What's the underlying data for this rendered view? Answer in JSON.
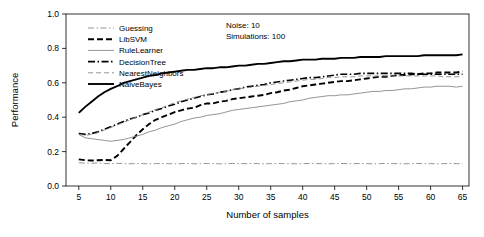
{
  "chart_data": {
    "type": "line",
    "title": "",
    "xlabel": "Number of samples",
    "ylabel": "Performance",
    "xlim": [
      3,
      66
    ],
    "ylim": [
      0.0,
      1.0
    ],
    "grid": false,
    "legend_position": "top-left inside plot",
    "annotations": [
      "Noise: 10",
      "Simulations: 100"
    ],
    "xticks": [
      5,
      10,
      15,
      20,
      25,
      30,
      35,
      40,
      45,
      50,
      55,
      60,
      65
    ],
    "yticks": [
      "0.0",
      "0.2",
      "0.4",
      "0.6",
      "0.8",
      "1.0"
    ],
    "x": [
      5,
      6,
      7,
      8,
      9,
      10,
      11,
      12,
      13,
      14,
      15,
      16,
      17,
      18,
      19,
      20,
      21,
      22,
      23,
      24,
      25,
      26,
      27,
      28,
      29,
      30,
      31,
      32,
      33,
      34,
      35,
      36,
      37,
      38,
      39,
      40,
      41,
      42,
      43,
      44,
      45,
      46,
      47,
      48,
      49,
      50,
      51,
      52,
      53,
      54,
      55,
      56,
      57,
      58,
      59,
      60,
      61,
      62,
      63,
      64,
      65
    ],
    "series": [
      {
        "name": "Guessing",
        "style": "dashdot-thin",
        "color": "#888888",
        "values": [
          0.135,
          0.133,
          0.132,
          0.134,
          0.131,
          0.13,
          0.132,
          0.13,
          0.129,
          0.131,
          0.13,
          0.129,
          0.13,
          0.131,
          0.13,
          0.129,
          0.13,
          0.131,
          0.129,
          0.13,
          0.131,
          0.13,
          0.129,
          0.13,
          0.131,
          0.13,
          0.13,
          0.131,
          0.13,
          0.129,
          0.13,
          0.131,
          0.13,
          0.13,
          0.129,
          0.13,
          0.131,
          0.13,
          0.13,
          0.129,
          0.13,
          0.131,
          0.13,
          0.13,
          0.131,
          0.13,
          0.129,
          0.13,
          0.131,
          0.13,
          0.13,
          0.129,
          0.13,
          0.131,
          0.13,
          0.13,
          0.129,
          0.13,
          0.131,
          0.13,
          0.13
        ]
      },
      {
        "name": "LibSVM",
        "style": "dashed-bold",
        "color": "#000000",
        "values": [
          0.155,
          0.15,
          0.148,
          0.15,
          0.152,
          0.15,
          0.175,
          0.215,
          0.255,
          0.295,
          0.33,
          0.36,
          0.385,
          0.4,
          0.415,
          0.43,
          0.44,
          0.45,
          0.455,
          0.47,
          0.48,
          0.48,
          0.49,
          0.495,
          0.505,
          0.51,
          0.515,
          0.52,
          0.525,
          0.53,
          0.54,
          0.545,
          0.555,
          0.56,
          0.57,
          0.58,
          0.585,
          0.59,
          0.595,
          0.6,
          0.605,
          0.61,
          0.61,
          0.615,
          0.62,
          0.625,
          0.63,
          0.635,
          0.635,
          0.64,
          0.645,
          0.645,
          0.65,
          0.65,
          0.655,
          0.655,
          0.66,
          0.66,
          0.66,
          0.66,
          0.665
        ]
      },
      {
        "name": "RuleLearner",
        "style": "solid-thin",
        "color": "#888888",
        "values": [
          0.3,
          0.28,
          0.275,
          0.27,
          0.265,
          0.26,
          0.265,
          0.27,
          0.28,
          0.29,
          0.3,
          0.315,
          0.325,
          0.34,
          0.35,
          0.36,
          0.375,
          0.385,
          0.395,
          0.4,
          0.41,
          0.415,
          0.42,
          0.43,
          0.44,
          0.445,
          0.45,
          0.455,
          0.46,
          0.465,
          0.47,
          0.475,
          0.48,
          0.49,
          0.495,
          0.5,
          0.51,
          0.515,
          0.52,
          0.525,
          0.525,
          0.53,
          0.53,
          0.535,
          0.54,
          0.545,
          0.55,
          0.55,
          0.555,
          0.555,
          0.56,
          0.565,
          0.565,
          0.57,
          0.575,
          0.575,
          0.58,
          0.58,
          0.58,
          0.575,
          0.58
        ]
      },
      {
        "name": "DecisionTree",
        "style": "dashdot-bold",
        "color": "#000000",
        "values": [
          0.305,
          0.3,
          0.305,
          0.315,
          0.33,
          0.345,
          0.36,
          0.375,
          0.39,
          0.4,
          0.415,
          0.425,
          0.44,
          0.45,
          0.465,
          0.475,
          0.49,
          0.5,
          0.51,
          0.52,
          0.53,
          0.535,
          0.545,
          0.55,
          0.56,
          0.565,
          0.575,
          0.58,
          0.585,
          0.59,
          0.6,
          0.605,
          0.61,
          0.615,
          0.62,
          0.625,
          0.63,
          0.63,
          0.635,
          0.64,
          0.645,
          0.65,
          0.65,
          0.65,
          0.655,
          0.655,
          0.655,
          0.655,
          0.655,
          0.655,
          0.655,
          0.655,
          0.655,
          0.65,
          0.65,
          0.65,
          0.65,
          0.65,
          0.65,
          0.65,
          0.65
        ]
      },
      {
        "name": "NearestNeighbors",
        "style": "dashed-thin",
        "color": "#888888",
        "values": [
          0.3,
          0.295,
          0.3,
          0.31,
          0.325,
          0.34,
          0.355,
          0.37,
          0.385,
          0.4,
          0.415,
          0.43,
          0.445,
          0.455,
          0.47,
          0.485,
          0.495,
          0.505,
          0.515,
          0.525,
          0.53,
          0.54,
          0.545,
          0.55,
          0.56,
          0.565,
          0.57,
          0.575,
          0.58,
          0.585,
          0.59,
          0.595,
          0.6,
          0.605,
          0.61,
          0.615,
          0.62,
          0.62,
          0.625,
          0.63,
          0.63,
          0.635,
          0.635,
          0.635,
          0.64,
          0.64,
          0.64,
          0.64,
          0.64,
          0.64,
          0.64,
          0.64,
          0.64,
          0.64,
          0.64,
          0.64,
          0.64,
          0.635,
          0.635,
          0.635,
          0.635
        ]
      },
      {
        "name": "NaiveBayes",
        "style": "solid-bold",
        "color": "#000000",
        "values": [
          0.425,
          0.46,
          0.49,
          0.52,
          0.545,
          0.565,
          0.58,
          0.6,
          0.61,
          0.62,
          0.63,
          0.64,
          0.645,
          0.655,
          0.66,
          0.665,
          0.67,
          0.675,
          0.675,
          0.68,
          0.685,
          0.685,
          0.69,
          0.69,
          0.695,
          0.7,
          0.7,
          0.705,
          0.71,
          0.71,
          0.715,
          0.72,
          0.725,
          0.725,
          0.73,
          0.735,
          0.735,
          0.735,
          0.74,
          0.74,
          0.74,
          0.745,
          0.745,
          0.745,
          0.75,
          0.75,
          0.75,
          0.75,
          0.755,
          0.755,
          0.755,
          0.755,
          0.755,
          0.755,
          0.76,
          0.76,
          0.76,
          0.76,
          0.76,
          0.76,
          0.765
        ]
      }
    ]
  }
}
